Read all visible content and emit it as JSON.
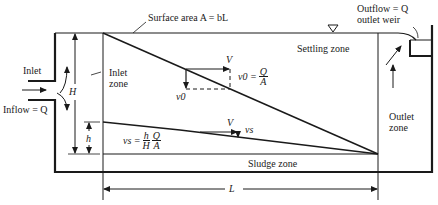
{
  "diagram": {
    "labels": {
      "surface_area": "Surface area A = bL",
      "outflow_line1": "Outflow = Q",
      "outflow_line2": "outlet weir",
      "inlet": "Inlet",
      "inflow": "Inflow = Q",
      "inlet_zone_line1": "Inlet",
      "inlet_zone_line2": "zone",
      "settling_zone": "Settling zone",
      "outlet_zone_line1": "Outlet",
      "outlet_zone_line2": "zone",
      "sludge_zone": "Sludge zone",
      "H": "H",
      "h": "h",
      "L": "L",
      "V_top": "V",
      "V_bottom": "V",
      "v0": "v0",
      "vs": "vs",
      "v0_eq_lhs": "v0 =",
      "v0_eq_num": "Q",
      "v0_eq_den": "A",
      "vs_eq_lhs": "vs =",
      "vs_eq_num1": "h",
      "vs_eq_den1": "H",
      "vs_eq_num2": "Q",
      "vs_eq_den2": "A"
    },
    "symbols": {
      "water_surface_marker": "triangle-down"
    }
  }
}
